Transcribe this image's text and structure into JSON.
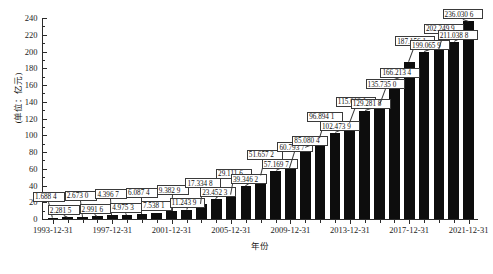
{
  "chart_data": {
    "type": "bar",
    "title": "",
    "xlabel": "年份",
    "ylabel": "(单位：亿元)",
    "ylim": [
      0,
      240
    ],
    "ytick_step": 20,
    "yticks": [
      0,
      20,
      40,
      60,
      80,
      100,
      120,
      140,
      160,
      180,
      200,
      220,
      240
    ],
    "grid": false,
    "legend": "none",
    "bar_color": "#0d0d0d",
    "categories": [
      "1993-12-31",
      "1994-12-31",
      "1995-12-31",
      "1996-12-31",
      "1997-12-31",
      "1998-12-31",
      "1999-12-31",
      "2000-12-31",
      "2001-12-31",
      "2002-12-31",
      "2003-12-31",
      "2004-12-31",
      "2005-12-31",
      "2006-12-31",
      "2007-12-31",
      "2008-12-31",
      "2009-12-31",
      "2010-12-31",
      "2011-12-31",
      "2012-12-31",
      "2013-12-31",
      "2014-12-31",
      "2015-12-31",
      "2016-12-31",
      "2017-12-31",
      "2018-12-31",
      "2019-12-31",
      "2020-12-31",
      "2021-12-31"
    ],
    "xtick_labels": [
      "1993-12-31",
      "1997-12-31",
      "2001-12-31",
      "2005-12-31",
      "2009-12-31",
      "2013-12-31",
      "2017-12-31",
      "2021-12-31"
    ],
    "values": [
      1.6884,
      2.2815,
      2.673,
      2.9916,
      4.3967,
      4.9753,
      6.0874,
      7.5381,
      9.3829,
      11.2439,
      17.3348,
      23.4523,
      29.1116,
      39.3462,
      51.6572,
      57.1697,
      60.7937,
      85.0804,
      96.8941,
      102.4739,
      115.0121,
      129.2818,
      135.735,
      166.2134,
      187.1561,
      199.0659,
      202.2499,
      211.0388,
      236.0306
    ],
    "value_labels": [
      "1.688 4",
      "2.281 5",
      "2.673 0",
      "2.991 6",
      "4.396 7",
      "4.975 3",
      "6.087 4",
      "7.538 1",
      "9.382 9",
      "11.243 9",
      "17.334 8",
      "23.452 3",
      "29.111 6",
      "39.346 2",
      "51.657 2",
      "57.169 7",
      "60.793 7",
      "85.080 4",
      "96.894 1",
      "102.473 9",
      "115.012 1",
      "129.281 8",
      "135.735 0",
      "166.213 4",
      "187.156 1",
      "199.065 9",
      "202.249 9",
      "211.038 8",
      "236.030 6"
    ]
  }
}
